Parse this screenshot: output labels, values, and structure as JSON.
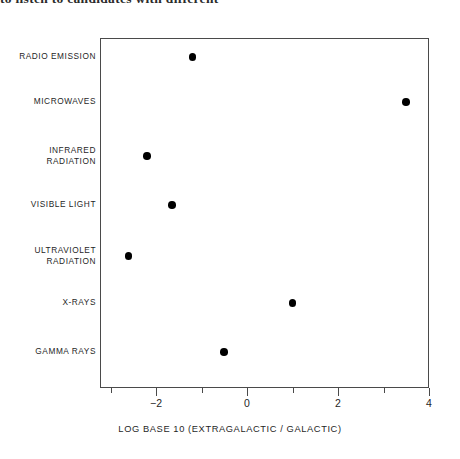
{
  "page": {
    "clipped_text_top": "to listen to candidates with different"
  },
  "chart_data": {
    "type": "scatter",
    "title": "",
    "xlabel": "LOG BASE 10 (EXTRAGALACTIC / GALACTIC)",
    "ylabel": "",
    "orientation": "horizontal",
    "grid": false,
    "legend": "none",
    "xlim": [
      -3.2,
      4.0
    ],
    "x_tick_labels": [
      "-2",
      "0",
      "2",
      "4"
    ],
    "x_tick_values": [
      -2,
      0,
      2,
      4
    ],
    "x_minor_tick_values": [
      -3,
      -1,
      1,
      3
    ],
    "categories": [
      "RADIO EMISSION",
      "MICROWAVES",
      "INFRARED\nRADIATION",
      "VISIBLE LIGHT",
      "ULTRAVIOLET\nRADIATION",
      "X-RAYS",
      "GAMMA RAYS"
    ],
    "values": [
      -1.2,
      3.5,
      -2.2,
      -1.65,
      -2.6,
      1.0,
      -0.5
    ],
    "points": [
      {
        "category": "RADIO EMISSION",
        "x": -1.2,
        "y_index": 0
      },
      {
        "category": "MICROWAVES",
        "x": 3.5,
        "y_index": 1
      },
      {
        "category": "INFRARED RADIATION",
        "x": -2.2,
        "y_index": 2
      },
      {
        "category": "VISIBLE LIGHT",
        "x": -1.65,
        "y_index": 3
      },
      {
        "category": "ULTRAVIOLET RADIATION",
        "x": -2.6,
        "y_index": 4
      },
      {
        "category": "X-RAYS",
        "x": 1.0,
        "y_index": 5
      },
      {
        "category": "GAMMA RAYS",
        "x": -0.5,
        "y_index": 6
      }
    ],
    "marker_color": "#000000",
    "axis_color": "#4a4a4a"
  }
}
